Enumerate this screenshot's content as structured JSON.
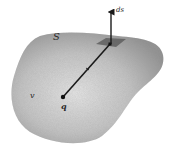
{
  "figure": {
    "labels": {
      "surface": "S",
      "area_element": "ds",
      "charge": "q",
      "volume": "v"
    },
    "colors": {
      "blob_fill_light": "#e2e2e2",
      "blob_fill_dark": "#9a9a9a",
      "line": "#1a1a1a",
      "patch": "#5a5a5a",
      "background": "#ffffff"
    }
  }
}
